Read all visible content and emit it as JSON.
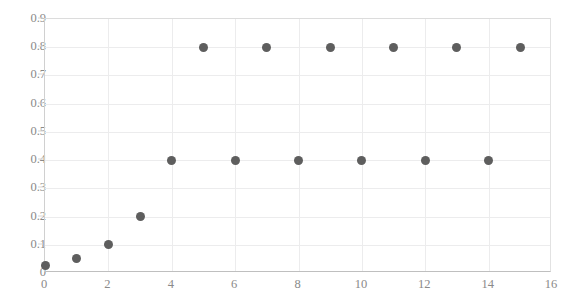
{
  "chart_data": {
    "type": "scatter",
    "title": "",
    "xlabel": "",
    "ylabel": "",
    "xlim": [
      0,
      16
    ],
    "ylim": [
      0,
      0.9
    ],
    "grid": true,
    "legend": null,
    "marker_color": "#5e5e5e",
    "gridline_color": "#ececed",
    "axis_color": "#bfbfbf",
    "tick_label_color": "#8a8a8a",
    "xticks": [
      0,
      2,
      4,
      6,
      8,
      10,
      12,
      14,
      16
    ],
    "xtick_labels": [
      "0",
      "2",
      "4",
      "6",
      "8",
      "10",
      "12",
      "14",
      "16"
    ],
    "yticks": [
      0,
      0.1,
      0.2,
      0.3,
      0.4,
      0.5,
      0.6,
      0.7,
      0.8,
      0.9
    ],
    "ytick_labels": [
      "0",
      "0.1",
      "0.2",
      "0.3",
      "0.4",
      "0.5",
      "0.6",
      "0.7",
      "0.8",
      "0.9"
    ],
    "series": [
      {
        "name": "series-1",
        "points": [
          {
            "x": 0,
            "y": 0.025
          },
          {
            "x": 1,
            "y": 0.05
          },
          {
            "x": 2,
            "y": 0.1
          },
          {
            "x": 3,
            "y": 0.2
          },
          {
            "x": 4,
            "y": 0.4
          },
          {
            "x": 5,
            "y": 0.8
          },
          {
            "x": 6,
            "y": 0.4
          },
          {
            "x": 7,
            "y": 0.8
          },
          {
            "x": 8,
            "y": 0.4
          },
          {
            "x": 9,
            "y": 0.8
          },
          {
            "x": 10,
            "y": 0.4
          },
          {
            "x": 11,
            "y": 0.8
          },
          {
            "x": 12,
            "y": 0.4
          },
          {
            "x": 13,
            "y": 0.8
          },
          {
            "x": 14,
            "y": 0.4
          },
          {
            "x": 15,
            "y": 0.8
          }
        ]
      }
    ]
  }
}
